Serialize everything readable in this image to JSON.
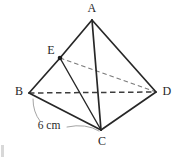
{
  "figure": {
    "type": "tetrahedron-diagram",
    "background_color": "#ffffff",
    "solid_stroke_color": "#272727",
    "dashed_stroke_color": "#4a4a4a",
    "leader_stroke_color": "#909090",
    "point_fill_color": "#1c1c1c",
    "vertices": [
      {
        "id": "A",
        "label": "A",
        "x": 92,
        "y": 20,
        "label_x": 92,
        "label_y": 8,
        "marked": false
      },
      {
        "id": "E",
        "label": "E",
        "x": 60,
        "y": 58,
        "label_x": 51,
        "label_y": 50,
        "marked": true
      },
      {
        "id": "B",
        "label": "B",
        "x": 29,
        "y": 93,
        "label_x": 19,
        "label_y": 91,
        "marked": false
      },
      {
        "id": "D",
        "label": "D",
        "x": 156,
        "y": 92,
        "label_x": 167,
        "label_y": 91,
        "marked": false
      },
      {
        "id": "C",
        "label": "C",
        "x": 101,
        "y": 130,
        "label_x": 102,
        "label_y": 141,
        "marked": false
      }
    ],
    "edges_solid": [
      {
        "id": "A-E",
        "from": "A",
        "to": "E"
      },
      {
        "id": "E-B",
        "from": "E",
        "to": "B"
      },
      {
        "id": "A-C",
        "from": "A",
        "to": "C"
      },
      {
        "id": "A-D",
        "from": "A",
        "to": "D"
      },
      {
        "id": "B-C",
        "from": "B",
        "to": "C"
      },
      {
        "id": "C-D",
        "from": "C",
        "to": "D"
      },
      {
        "id": "E-C",
        "from": "E",
        "to": "C"
      }
    ],
    "edges_dashed": [
      {
        "id": "B-D",
        "from": "B",
        "to": "D"
      },
      {
        "id": "E-D",
        "from": "E",
        "to": "D"
      }
    ],
    "dimensions": [
      {
        "id": "BC-length",
        "text": "6 cm",
        "label_x": 49,
        "label_y": 126,
        "measures_edge": "B-C"
      }
    ]
  }
}
